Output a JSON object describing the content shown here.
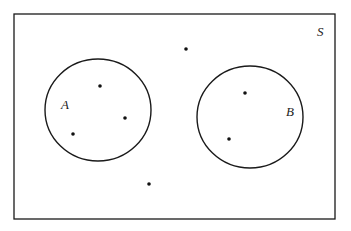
{
  "diagram": {
    "type": "venn",
    "universe": {
      "label": "S",
      "x": 14,
      "y": 14,
      "width": 321,
      "height": 205,
      "label_x": 317,
      "label_y": 36
    },
    "sets": [
      {
        "label": "A",
        "cx": 98,
        "cy": 110,
        "rx": 53,
        "ry": 51,
        "label_x": 61,
        "label_y": 109
      },
      {
        "label": "B",
        "cx": 250,
        "cy": 117,
        "rx": 53,
        "ry": 51,
        "label_x": 286,
        "label_y": 116
      }
    ],
    "points": [
      {
        "region": "A",
        "x": 100,
        "y": 86
      },
      {
        "region": "A",
        "x": 125,
        "y": 118
      },
      {
        "region": "A",
        "x": 73,
        "y": 134
      },
      {
        "region": "B",
        "x": 245,
        "y": 93
      },
      {
        "region": "B",
        "x": 229,
        "y": 139
      },
      {
        "region": "S only",
        "x": 186,
        "y": 49
      },
      {
        "region": "S only",
        "x": 149,
        "y": 184
      }
    ],
    "colors": {
      "stroke": "#1a1a1a",
      "fill": "#ffffff",
      "point": "#111111"
    }
  }
}
